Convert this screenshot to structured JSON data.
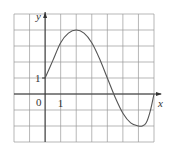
{
  "chart_data": {
    "type": "line",
    "title": "",
    "xlabel": "x",
    "ylabel": "y",
    "xlim": [
      -2,
      7
    ],
    "ylim": [
      -3,
      5
    ],
    "grid": true,
    "tick_labels": {
      "origin": "0",
      "x_one": "1",
      "y_one": "1"
    },
    "series": [
      {
        "name": "f(x)",
        "x": [
          0,
          0.5,
          1,
          1.5,
          2,
          2.5,
          3,
          3.5,
          4,
          4.5,
          5,
          5.5,
          6,
          6.25,
          6.5,
          6.75,
          7
        ],
        "values": [
          1,
          2.1,
          3.2,
          3.8,
          4.0,
          3.8,
          3.2,
          2.2,
          1.0,
          -0.2,
          -1.2,
          -1.8,
          -2.0,
          -2.0,
          -1.8,
          -1.1,
          0
        ]
      }
    ],
    "colors": {
      "grid": "#9a9a9a",
      "axis": "#333333",
      "curve": "#555555"
    }
  }
}
